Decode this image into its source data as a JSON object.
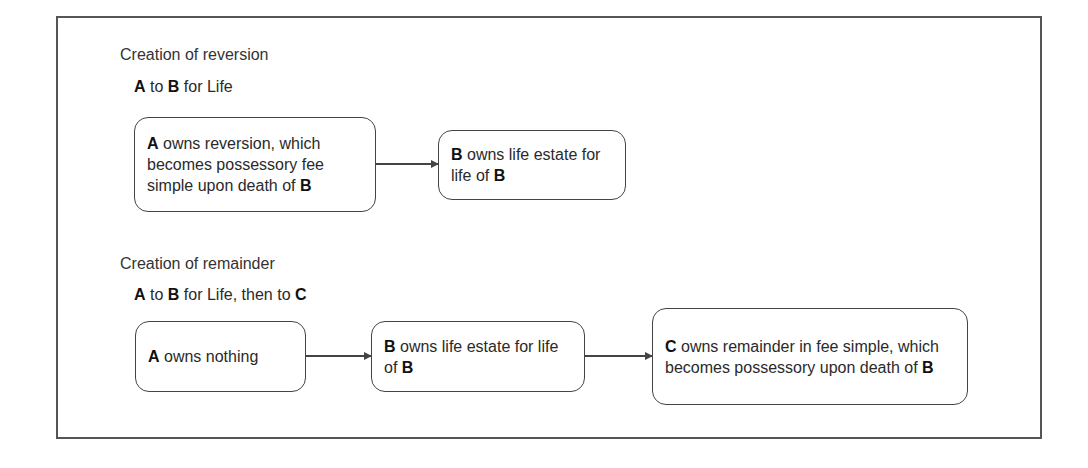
{
  "diagram": {
    "sections": [
      {
        "title": "Creation of reversion",
        "conveyance": {
          "parts": [
            {
              "text": "A",
              "bold": true
            },
            {
              "text": " to ",
              "bold": false
            },
            {
              "text": "B",
              "bold": true
            },
            {
              "text": " for Life",
              "bold": false
            }
          ]
        },
        "boxes": [
          {
            "id": "a-reversion",
            "parts": [
              {
                "text": "A",
                "bold": true
              },
              {
                "text": " owns reversion, which becomes possessory fee simple upon death of ",
                "bold": false
              },
              {
                "text": "B",
                "bold": true
              }
            ]
          },
          {
            "id": "b-life-estate",
            "parts": [
              {
                "text": "B",
                "bold": true
              },
              {
                "text": " owns life estate for life of ",
                "bold": false
              },
              {
                "text": "B",
                "bold": true
              }
            ]
          }
        ],
        "arrows": [
          {
            "from": "a-reversion",
            "to": "b-life-estate"
          }
        ]
      },
      {
        "title": "Creation of remainder",
        "conveyance": {
          "parts": [
            {
              "text": "A",
              "bold": true
            },
            {
              "text": " to ",
              "bold": false
            },
            {
              "text": "B",
              "bold": true
            },
            {
              "text": " for Life, then to ",
              "bold": false
            },
            {
              "text": "C",
              "bold": true
            }
          ]
        },
        "boxes": [
          {
            "id": "a-nothing",
            "parts": [
              {
                "text": "A",
                "bold": true
              },
              {
                "text": " owns nothing",
                "bold": false
              }
            ]
          },
          {
            "id": "b-life-estate-2",
            "parts": [
              {
                "text": "B",
                "bold": true
              },
              {
                "text": " owns life estate for life of ",
                "bold": false
              },
              {
                "text": "B",
                "bold": true
              }
            ]
          },
          {
            "id": "c-remainder",
            "parts": [
              {
                "text": "C",
                "bold": true
              },
              {
                "text": " owns remainder in fee simple, which becomes possessory upon death of ",
                "bold": false
              },
              {
                "text": "B",
                "bold": true
              }
            ]
          }
        ],
        "arrows": [
          {
            "from": "a-nothing",
            "to": "b-life-estate-2"
          },
          {
            "from": "b-life-estate-2",
            "to": "c-remainder"
          }
        ]
      }
    ]
  }
}
